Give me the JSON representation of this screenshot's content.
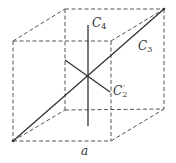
{
  "diagram": {
    "colors": {
      "edge": "#555555",
      "axis": "#333333",
      "label": "#333333",
      "background": "#ffffff"
    },
    "cube": {
      "front_top_left": [
        13,
        41
      ],
      "front_top_right": [
        111,
        41
      ],
      "front_bottom_left": [
        13,
        141
      ],
      "front_bottom_right": [
        111,
        141
      ],
      "back_top_left": [
        65,
        9
      ],
      "back_top_right": [
        164,
        9
      ],
      "back_bottom_left": [
        65,
        110
      ],
      "back_bottom_right": [
        164,
        109
      ],
      "edge_style": "dashed"
    },
    "axes": [
      {
        "name": "C4",
        "from": [
          88,
          25
        ],
        "to": [
          88,
          126
        ]
      },
      {
        "name": "C3",
        "from": [
          13,
          141
        ],
        "to": [
          164,
          9
        ]
      },
      {
        "name": "C2prime",
        "from": [
          65,
          60
        ],
        "to": [
          110,
          92
        ]
      }
    ],
    "center": [
      88,
      76
    ],
    "labels": {
      "c4": {
        "base": "C",
        "sub": "4"
      },
      "c3": {
        "base": "C",
        "sub": "3"
      },
      "c2prime": {
        "base": "C",
        "sub": "2",
        "sup": "′"
      },
      "edge_length": "a"
    }
  }
}
